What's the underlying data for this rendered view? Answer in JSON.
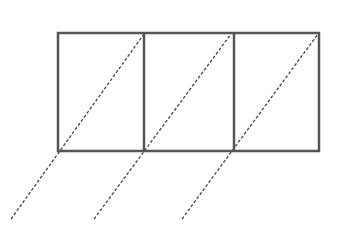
{
  "diagram": {
    "colors": {
      "background": "#ffffff",
      "solid_stroke": "#555555",
      "dashed_stroke": "#444444"
    },
    "outer_rect": {
      "x": 58,
      "y": 33,
      "width": 261,
      "height": 118,
      "stroke_width": 2.5
    },
    "dividers": [
      {
        "x": 144,
        "y1": 33,
        "y2": 151
      },
      {
        "x": 234,
        "y1": 33,
        "y2": 151
      }
    ],
    "dashed_lines": [
      {
        "id": "diag-1",
        "x1": 11,
        "y1": 219,
        "x2": 144,
        "y2": 34
      },
      {
        "id": "diag-2",
        "x1": 94,
        "y1": 219,
        "x2": 231,
        "y2": 34
      },
      {
        "id": "diag-3",
        "x1": 182,
        "y1": 219,
        "x2": 318,
        "y2": 34
      }
    ],
    "dash_pattern": "3,2",
    "dash_stroke_width": 1.3
  }
}
